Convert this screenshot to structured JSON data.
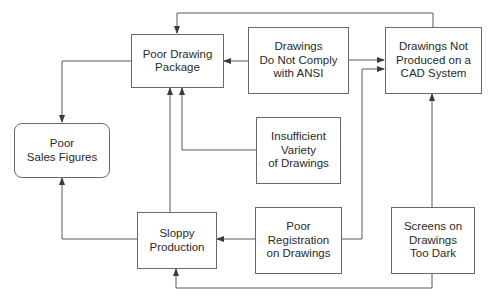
{
  "diagram": {
    "type": "cause-effect flow diagram",
    "nodes": {
      "sales": {
        "id": "poor-sales-figures",
        "lines": [
          "Poor",
          "Sales Figures"
        ]
      },
      "package": {
        "id": "poor-drawing-package",
        "lines": [
          "Poor Drawing",
          "Package"
        ]
      },
      "ansi": {
        "id": "drawings-do-not-comply-with-ansi",
        "lines": [
          "Drawings",
          "Do Not Comply",
          "with ANSI"
        ]
      },
      "cad": {
        "id": "drawings-not-produced-on-cad",
        "lines": [
          "Drawings Not",
          "Produced on a",
          "CAD System"
        ]
      },
      "variety": {
        "id": "insufficient-variety-of-drawings",
        "lines": [
          "Insufficient",
          "Variety",
          "of Drawings"
        ]
      },
      "sloppy": {
        "id": "sloppy-production",
        "lines": [
          "Sloppy",
          "Production"
        ]
      },
      "registration": {
        "id": "poor-registration-on-drawings",
        "lines": [
          "Poor",
          "Registration",
          "on Drawings"
        ]
      },
      "screens": {
        "id": "screens-on-drawings-too-dark",
        "lines": [
          "Screens on",
          "Drawings",
          "Too Dark"
        ]
      }
    },
    "edges": [
      {
        "from": "Drawings Not Produced on a CAD System",
        "to": "Poor Drawing Package"
      },
      {
        "from": "Drawings Do Not Comply with ANSI",
        "to": "Poor Drawing Package"
      },
      {
        "from": "Drawings Do Not Comply with ANSI",
        "to": "Drawings Not Produced on a CAD System"
      },
      {
        "from": "Poor Registration on Drawings",
        "to": "Drawings Not Produced on a CAD System"
      },
      {
        "from": "Insufficient Variety of Drawings",
        "to": "Poor Drawing Package"
      },
      {
        "from": "Sloppy Production",
        "to": "Poor Drawing Package"
      },
      {
        "from": "Poor Drawing Package",
        "to": "Poor Sales Figures"
      },
      {
        "from": "Sloppy Production",
        "to": "Poor Sales Figures"
      },
      {
        "from": "Poor Registration on Drawings",
        "to": "Sloppy Production"
      },
      {
        "from": "Screens on Drawings Too Dark",
        "to": "Drawings Not Produced on a CAD System"
      },
      {
        "from": "Screens on Drawings Too Dark",
        "to": "Sloppy Production"
      }
    ],
    "colors": {
      "line": "#5a5a5a",
      "border": "#6a6a6a",
      "text": "#2a2a2a",
      "background": "#ffffff"
    }
  }
}
